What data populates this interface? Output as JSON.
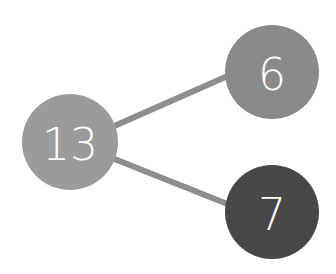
{
  "diagram": {
    "type": "number-bond",
    "background": "#ffffff",
    "edge_color": "#8e8e8e",
    "edge_width": 6,
    "nodes": [
      {
        "id": "whole",
        "label": "13",
        "cx": 70,
        "cy": 142,
        "r": 48,
        "color": "#9b9b9b"
      },
      {
        "id": "part-top",
        "label": "6",
        "cx": 272,
        "cy": 72,
        "r": 47,
        "color": "#8a8a8a"
      },
      {
        "id": "part-bottom",
        "label": "7",
        "cx": 272,
        "cy": 212,
        "r": 47,
        "color": "#484848"
      }
    ],
    "edges": [
      {
        "from": "whole",
        "to": "part-top",
        "x1": 112,
        "y1": 127,
        "x2": 230,
        "y2": 75
      },
      {
        "from": "whole",
        "to": "part-bottom",
        "x1": 112,
        "y1": 158,
        "x2": 230,
        "y2": 205
      }
    ]
  }
}
